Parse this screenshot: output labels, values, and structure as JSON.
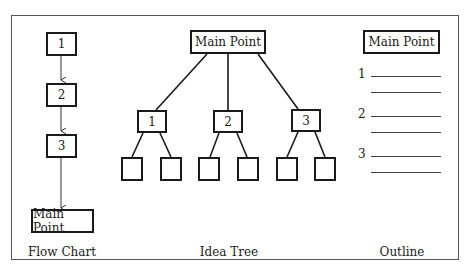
{
  "diagrams": {
    "flow_chart": {
      "caption": "Flow Chart",
      "steps": [
        "1",
        "2",
        "3"
      ],
      "end": "Main Point"
    },
    "idea_tree": {
      "caption": "Idea Tree",
      "root": "Main Point",
      "branches": [
        {
          "label": "1",
          "leaves": 2
        },
        {
          "label": "2",
          "leaves": 2
        },
        {
          "label": "3",
          "leaves": 2
        }
      ]
    },
    "outline": {
      "caption": "Outline",
      "title": "Main Point",
      "items": [
        "1",
        "2",
        "3"
      ]
    }
  }
}
